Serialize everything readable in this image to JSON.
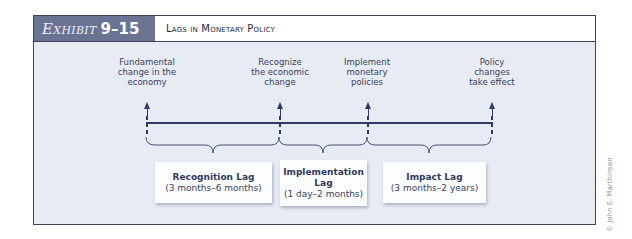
{
  "header": {
    "exhibit_word": "Exhibit",
    "exhibit_number": "9–15",
    "title": "Lags in Monetary Policy"
  },
  "timeline": {
    "events": [
      {
        "label_lines": [
          "Fundamental",
          "change in the",
          "economy"
        ]
      },
      {
        "label_lines": [
          "Recognize",
          "the economic",
          "change"
        ]
      },
      {
        "label_lines": [
          "Implement",
          "monetary",
          "policies"
        ]
      },
      {
        "label_lines": [
          "Policy",
          "changes",
          "take effect"
        ]
      }
    ],
    "lags": [
      {
        "name": "Recognition Lag",
        "name_lines": [
          "Recognition Lag"
        ],
        "range": "(3 months–6 months)"
      },
      {
        "name": "Implementation Lag",
        "name_lines": [
          "Implementation",
          "Lag"
        ],
        "range": "(1 day–2 months)"
      },
      {
        "name": "Impact Lag",
        "name_lines": [
          "Impact Lag"
        ],
        "range": "(3 months–2 years)"
      }
    ]
  },
  "credit": "© John E. Marthinsen",
  "colors": {
    "frame_border": "#3d4460",
    "exhibit_bg": "#6b7393",
    "panel_bg": "#e6ebf4",
    "line": "#2f3a66"
  }
}
